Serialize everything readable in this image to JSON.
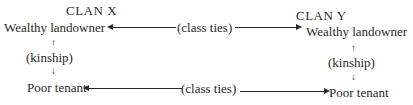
{
  "diagram": {
    "clan_x": {
      "title": "CLAN X",
      "upper": "Wealthy landowner",
      "link": "(kinship)",
      "lower": "Poor tenant"
    },
    "clan_y": {
      "title": "CLAN Y",
      "upper": "Wealthy landowner",
      "link": "(kinship)",
      "lower": "Poor tenant"
    },
    "top_link": "(class ties)",
    "bottom_link": "(class ties)",
    "arrows": {
      "up": "↑",
      "down": "↓"
    }
  }
}
